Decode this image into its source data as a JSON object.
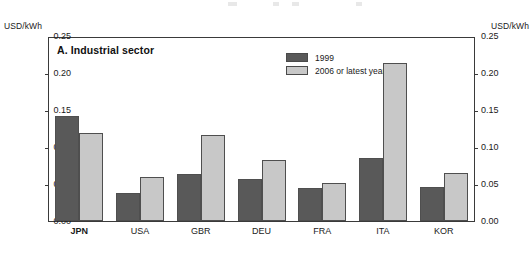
{
  "chart_data": {
    "type": "bar",
    "title": "A. Industrial sector",
    "xlabel": "",
    "ylabel": "USD/kWh",
    "ylabel_right": "USD/kWh",
    "ylim": [
      0.0,
      0.25
    ],
    "ytick_labels": [
      "0.25",
      "0.20",
      "0.15",
      "0.10",
      "0.05",
      "0.00"
    ],
    "ytick_values": [
      0.25,
      0.2,
      0.15,
      0.1,
      0.05,
      0.0
    ],
    "grid": false,
    "legend_position": "top-right-inside",
    "categories": [
      "JPN",
      "USA",
      "GBR",
      "DEU",
      "FRA",
      "ITA",
      "KOR"
    ],
    "emphasized_category": "JPN",
    "series": [
      {
        "name": "1999",
        "color": "#595959",
        "values": [
          0.142,
          0.038,
          0.063,
          0.057,
          0.044,
          0.085,
          0.046
        ]
      },
      {
        "name": "2006 or latest year",
        "name_superscript": "c",
        "color": "#c8c8c8",
        "values": [
          0.119,
          0.06,
          0.116,
          0.082,
          0.051,
          0.213,
          0.065
        ]
      }
    ]
  },
  "colors": {
    "series_1999": "#595959",
    "series_2006": "#c8c8c8",
    "frame": "#3a3a3a",
    "text": "#1a1a1a",
    "background": "#ffffff"
  }
}
